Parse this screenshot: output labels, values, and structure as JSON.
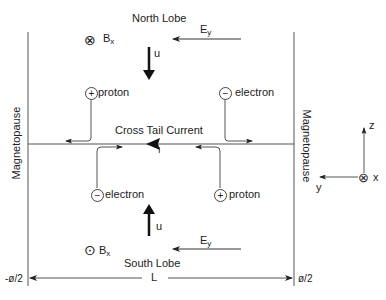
{
  "diagram": {
    "title_north": "North Lobe",
    "title_south": "South Lobe",
    "current_label": "Cross Tail Current",
    "current_symbol": "I",
    "boundary_left": "Magnetopause",
    "boundary_right": "Magnetopause",
    "width_label": "L",
    "left_edge_label": "-ø/2",
    "right_edge_label": "ø/2",
    "north": {
      "field_symbol": "⊗",
      "field_label": "B",
      "field_sub": "x",
      "efield_label": "E",
      "efield_sub": "y",
      "flow_label": "u",
      "particle_left": {
        "charge": "+",
        "label": "proton"
      },
      "particle_right": {
        "charge": "−",
        "label": "electron"
      }
    },
    "south": {
      "field_symbol": "⊙",
      "field_label": "B",
      "field_sub": "x",
      "efield_label": "E",
      "efield_sub": "y",
      "flow_label": "u",
      "particle_left": {
        "charge": "−",
        "label": "electron"
      },
      "particle_right": {
        "charge": "+",
        "label": "proton"
      }
    },
    "axes": {
      "z": "z",
      "y": "y",
      "x": "x"
    },
    "colors": {
      "line": "#333333",
      "thin_line": "#555555",
      "background": "#ffffff"
    }
  }
}
